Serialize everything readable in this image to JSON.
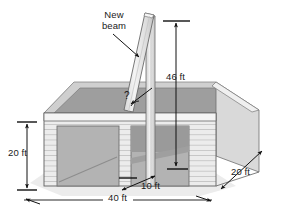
{
  "figure": {
    "kind": "technical-illustration",
    "background_color": "#ffffff"
  },
  "labels": {
    "callout_beam_line1": "New",
    "callout_beam_line2": "beam",
    "height_post": "46 ft",
    "wall_height": "20 ft",
    "building_width": "40 ft",
    "beam_base_inset": "10 ft",
    "building_depth": "20 ft",
    "unknown_angle": "?"
  },
  "dimensions": {
    "post_height_ft": 46,
    "wall_height_ft": 20,
    "width_ft": 40,
    "beam_base_offset_ft": 10,
    "depth_ft": 20,
    "angle_deg": null
  },
  "colors": {
    "ink": "#1a1a1a",
    "outline": "#4a4a4a",
    "siding_face": "#ececec",
    "siding_line": "#b4b4b4",
    "door_panel": "#b2b2b2",
    "side_wall": "#d9d9d9",
    "interior_back": "#9c9c9c",
    "interior_floor": "#adadad",
    "rim_top": "#f2f2f2",
    "beam_light": "#efefef",
    "beam_shade": "#c9c9c9",
    "ground_shadow": "#e4e4e4"
  },
  "annotations": {
    "arrow_style": "solid-filled",
    "leader_from_beam_label": "points down-right to diagonal beam",
    "angle_marker": "arc at base of beam with question mark"
  }
}
